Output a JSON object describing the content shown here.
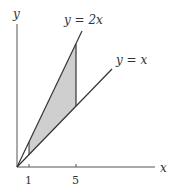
{
  "diagram": {
    "type": "region-between-lines",
    "axes": {
      "x_label": "x",
      "y_label": "y"
    },
    "lines": [
      {
        "label": "y = 2x",
        "slope": 2
      },
      {
        "label": "y = x",
        "slope": 1
      }
    ],
    "ticks": [
      {
        "value": "1"
      },
      {
        "value": "5"
      }
    ],
    "shaded_region": {
      "x_from": 1,
      "x_to": 5,
      "between": [
        "y = x",
        "y = 2x"
      ],
      "fill": "#cfcfcf"
    },
    "colors": {
      "line": "#333333",
      "shade": "#cfcfcf"
    }
  }
}
